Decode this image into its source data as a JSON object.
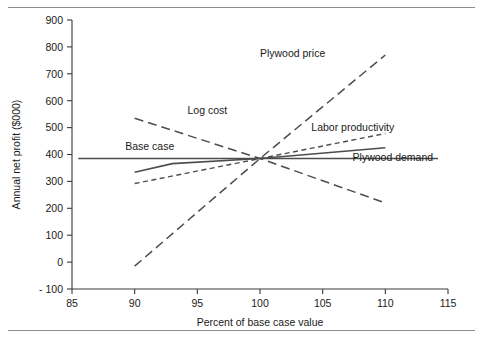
{
  "figure": {
    "name": "sensitivity-spider-chart",
    "has_top_rule": true,
    "has_bottom_rule": true,
    "background": "#ffffff"
  },
  "chart_data": {
    "type": "line",
    "title": "",
    "xlabel": "Percent of base case value",
    "ylabel": "Annual net profit ($000)",
    "xlim": [
      85,
      115
    ],
    "ylim": [
      -100,
      900
    ],
    "xticks": [
      85,
      90,
      95,
      100,
      105,
      110,
      115
    ],
    "xticklabels": [
      "85",
      "90",
      "95",
      "100",
      "105",
      "110",
      "115"
    ],
    "yticks": [
      -100,
      0,
      100,
      200,
      300,
      400,
      500,
      600,
      700,
      800,
      900
    ],
    "yticklabels": [
      "- 100",
      "0",
      "100",
      "200",
      "300",
      "400",
      "500",
      "600",
      "700",
      "800",
      "900"
    ],
    "grid": false,
    "legend": "inline-labels",
    "base_case_value": 385,
    "series": [
      {
        "name": "Base case",
        "style": "solid",
        "label": "Base case",
        "label_x": 91.2,
        "label_y": 430,
        "x": [
          85.5,
          114.2
        ],
        "values": [
          385,
          385
        ]
      },
      {
        "name": "Log cost",
        "style": "long-dash",
        "label": "Log cost",
        "label_x": 95.8,
        "label_y": 563,
        "x": [
          90,
          100,
          110
        ],
        "values": [
          535,
          385,
          220
        ]
      },
      {
        "name": "Plywood price",
        "style": "long-dash",
        "label": "Plywood price",
        "label_x": 102.6,
        "label_y": 775,
        "x": [
          90,
          100,
          110
        ],
        "values": [
          -15,
          385,
          770
        ]
      },
      {
        "name": "Labor productivity",
        "style": "short-dash",
        "label": "Labor productivity",
        "label_x": 107.4,
        "label_y": 500,
        "x": [
          90,
          100,
          110
        ],
        "values": [
          292,
          385,
          478
        ]
      },
      {
        "name": "Plywood demand",
        "style": "solid",
        "label": "Plywood demand",
        "label_x": 110.6,
        "label_y": 390,
        "x": [
          90,
          93,
          100,
          110
        ],
        "values": [
          334,
          366,
          385,
          425
        ]
      }
    ]
  }
}
